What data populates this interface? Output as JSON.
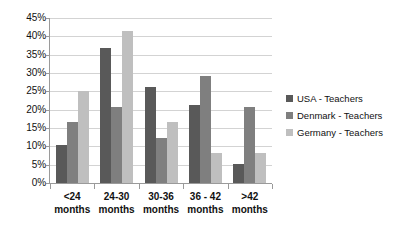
{
  "chart_data": {
    "type": "bar",
    "title": "",
    "subtitle": "",
    "xlabel": "",
    "ylabel": "",
    "ylim": [
      0,
      45
    ],
    "ytick_step": 5,
    "ytick_labels": [
      "0%",
      "5%",
      "10%",
      "15%",
      "20%",
      "25%",
      "30%",
      "35%",
      "40%",
      "45%"
    ],
    "ytick_values": [
      0,
      5,
      10,
      15,
      20,
      25,
      30,
      35,
      40,
      45
    ],
    "grid": true,
    "legend_position": "right",
    "categories": [
      "<24 months",
      "24-30 months",
      "30-36 months",
      "36 - 42 months",
      ">42 months"
    ],
    "category_lines": [
      [
        "<24",
        "months"
      ],
      [
        "24-30",
        "months"
      ],
      [
        "30-36",
        "months"
      ],
      [
        "36 - 42",
        "months"
      ],
      [
        ">42",
        "months"
      ]
    ],
    "series": [
      {
        "name": "USA - Teachers",
        "color": "#595959",
        "values": [
          10.5,
          36.8,
          26.3,
          21.2,
          5.2
        ]
      },
      {
        "name": "Denmark - Teachers",
        "color": "#7f7f7f",
        "values": [
          16.7,
          20.7,
          12.4,
          29.1,
          20.7
        ]
      },
      {
        "name": "Germany - Teachers",
        "color": "#bfbfbf",
        "values": [
          25.0,
          41.5,
          16.6,
          8.1,
          8.1
        ]
      }
    ]
  },
  "legend": {
    "items": [
      {
        "label": "USA - Teachers",
        "swatch_name": "legend-swatch-usa"
      },
      {
        "label": "Denmark - Teachers",
        "swatch_name": "legend-swatch-denmark"
      },
      {
        "label": "Germany - Teachers",
        "swatch_name": "legend-swatch-germany"
      }
    ]
  }
}
